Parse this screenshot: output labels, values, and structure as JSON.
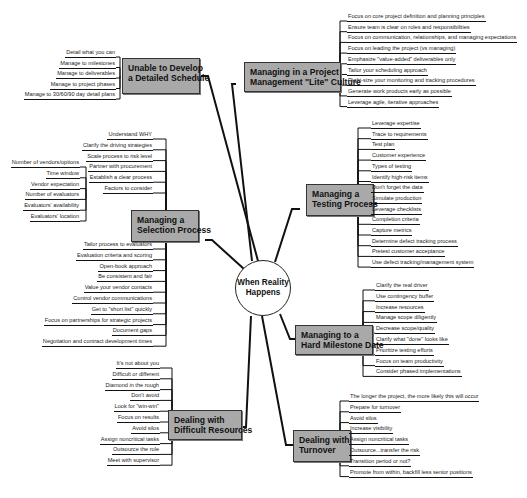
{
  "center": {
    "line1": "When Reality",
    "line2": "Happens"
  },
  "branches": {
    "schedule": {
      "title1": "Unable to Develop",
      "title2": "a Detailed Schedule",
      "items": [
        "Detail what you can",
        "Manage to milestones",
        "Manage to deliverables",
        "Manage to project phases",
        "Manage to 30/60/90 day detail plans"
      ]
    },
    "lite": {
      "title1": "Managing in a Project",
      "title2": "Management \"Lite\" Culture",
      "items": [
        "Focus on core project definition and planning principles",
        "Ensure team is clear on roles and responsibilities",
        "Focus on communication, relationships, and managing expectations",
        "Focus on leading the project (vs managing)",
        "Emphasize \"value-added\" deliverables only",
        "Tailor your scheduling approach",
        "Right-size your monitoring and tracking procedures",
        "Generate work products early as possible",
        "Leverage agile, iterative approaches"
      ]
    },
    "testing": {
      "title1": "Managing a",
      "title2": "Testing Process",
      "items": [
        "Leverage expertise",
        "Trace to requirements",
        "Test plan",
        "Customer experience",
        "Types of testing",
        "Identify high-risk items",
        "Don't forget the data",
        "Simulate production",
        "Leverage checklists",
        "Completion criteria",
        "Capture metrics",
        "Determine defect tracking process",
        "Pretest customer acceptance",
        "Use defect tracking/management system"
      ]
    },
    "selection": {
      "title1": "Managing a",
      "title2": "Selection Process",
      "items_top": [
        "Understand WHY",
        "Clarify the driving strategies",
        "Scale process to risk level",
        "Partner with procurement",
        "Establish a clear process",
        "Factors to consider"
      ],
      "factors": [
        "Number of vendors/options",
        "Time window",
        "Vendor expectation",
        "Number of evaluators",
        "Evaluators' availability",
        "Evaluators' location"
      ],
      "items_bottom": [
        "Tailor process to evaluators",
        "Evaluation criteria and scoring",
        "Open-book approach",
        "Be consistent and fair",
        "Value your vendor contacts",
        "Control vendor communications",
        "Get to \"short list\" quickly",
        "Focus on partnerships for strategic projects",
        "Document gaps",
        "Negotiation and contract development times"
      ]
    },
    "milestone": {
      "title1": "Managing to a",
      "title2": "Hard Milestone Date",
      "items": [
        "Clarify the real driver",
        "Use contingency buffer",
        "Increase resources",
        "Manage scope diligently",
        "Decrease scope/quality",
        "Clarify what \"done\" looks like",
        "Prioritize testing efforts",
        "Focus on team productivity",
        "Consider phased implementations"
      ]
    },
    "difficult": {
      "title1": "Dealing with",
      "title2": "Difficult Resources",
      "items": [
        "It's not about you",
        "Difficult or different",
        "Diamond in the rough",
        "Don't avoid",
        "Look for \"win-win\"",
        "Focus on results",
        "Avoid silos",
        "Assign noncritical tasks",
        "Outsource the role",
        "Meet with supervisor"
      ]
    },
    "turnover": {
      "title1": "Dealing with",
      "title2": "Turnover",
      "items": [
        "The longer the project, the more likely this will occur",
        "Prepare for turnover",
        "Avoid silos",
        "Increase visibility",
        "Assign noncritical tasks",
        "Outsource...transfer the risk",
        "Transition period or not?",
        "Promote from within, backfill less senior positions"
      ]
    }
  },
  "colors": {
    "topic_fill": "#a9a9a9",
    "line": "#111111",
    "background": "#ffffff"
  }
}
